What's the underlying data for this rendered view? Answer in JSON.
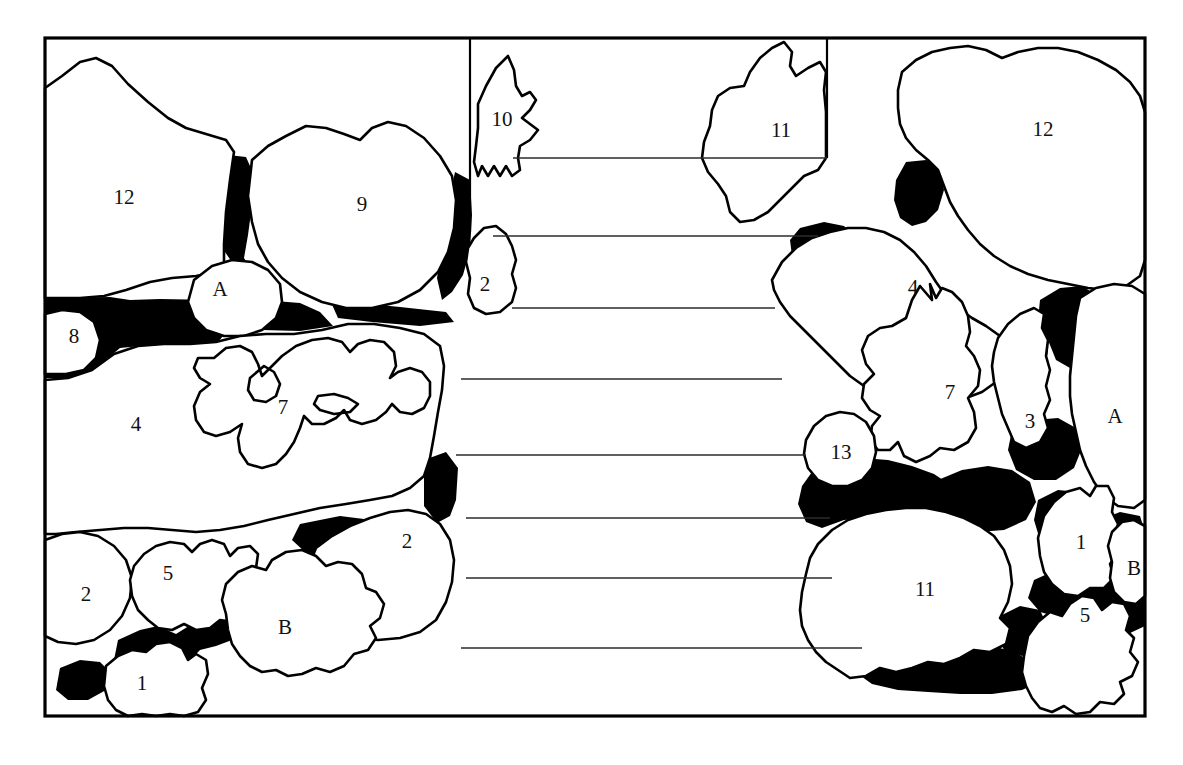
{
  "figure": {
    "panel_count": 2,
    "frame_color": "#000000",
    "grain_fill": "#ffffff",
    "interstitial_fill": "#000000",
    "outline_color": "#000000",
    "tie_line_color": "#2b2b2b"
  },
  "labels": {
    "left_panel": [
      {
        "id": "l-12",
        "text": "12",
        "x": 124,
        "y": 199
      },
      {
        "id": "l-9",
        "text": "9",
        "x": 362,
        "y": 206
      },
      {
        "id": "l-A",
        "text": "A",
        "x": 220,
        "y": 291
      },
      {
        "id": "l-8",
        "text": "8",
        "x": 74,
        "y": 338
      },
      {
        "id": "l-4",
        "text": "4",
        "x": 136,
        "y": 426
      },
      {
        "id": "l-7",
        "text": "7",
        "x": 283,
        "y": 409
      },
      {
        "id": "l-2a",
        "text": "2",
        "x": 485,
        "y": 286
      },
      {
        "id": "l-2b",
        "text": "2",
        "x": 407,
        "y": 543
      },
      {
        "id": "l-2c",
        "text": "2",
        "x": 86,
        "y": 596
      },
      {
        "id": "l-5",
        "text": "5",
        "x": 168,
        "y": 575
      },
      {
        "id": "l-B",
        "text": "B",
        "x": 285,
        "y": 629
      },
      {
        "id": "l-1",
        "text": "1",
        "x": 142,
        "y": 685
      },
      {
        "id": "l-10",
        "text": "10",
        "x": 502,
        "y": 121
      }
    ],
    "right_panel": [
      {
        "id": "r-11a",
        "text": "11",
        "x": 781,
        "y": 132
      },
      {
        "id": "r-12",
        "text": "12",
        "x": 1043,
        "y": 131
      },
      {
        "id": "r-4",
        "text": "4",
        "x": 913,
        "y": 289
      },
      {
        "id": "r-7",
        "text": "7",
        "x": 950,
        "y": 394
      },
      {
        "id": "r-3",
        "text": "3",
        "x": 1030,
        "y": 423
      },
      {
        "id": "r-A",
        "text": "A",
        "x": 1115,
        "y": 418
      },
      {
        "id": "r-13",
        "text": "13",
        "x": 841,
        "y": 454
      },
      {
        "id": "r-1",
        "text": "1",
        "x": 1081,
        "y": 544
      },
      {
        "id": "r-B",
        "text": "B",
        "x": 1134,
        "y": 570
      },
      {
        "id": "r-11b",
        "text": "11",
        "x": 925,
        "y": 591
      },
      {
        "id": "r-5",
        "text": "5",
        "x": 1085,
        "y": 617
      }
    ]
  },
  "tie_lines": [
    {
      "id": "tie-1",
      "y": 158,
      "x1": 513,
      "x2": 827
    },
    {
      "id": "tie-2",
      "y": 236,
      "x1": 493,
      "x2": 818
    },
    {
      "id": "tie-3",
      "y": 308,
      "x1": 512,
      "x2": 775
    },
    {
      "id": "tie-4",
      "y": 379,
      "x1": 461,
      "x2": 782
    },
    {
      "id": "tie-5",
      "y": 455,
      "x1": 456,
      "x2": 806
    },
    {
      "id": "tie-6",
      "y": 518,
      "x1": 466,
      "x2": 830
    },
    {
      "id": "tie-7",
      "y": 578,
      "x1": 466,
      "x2": 832
    },
    {
      "id": "tie-8",
      "y": 648,
      "x1": 461,
      "x2": 862
    }
  ],
  "panel_dividers": [
    {
      "id": "divider-left",
      "x": 470,
      "y1": 40,
      "y2": 232
    },
    {
      "id": "divider-right",
      "x": 827,
      "y1": 40,
      "y2": 158
    }
  ],
  "frame": {
    "x": 45,
    "y": 38,
    "width": 1100,
    "height": 678
  }
}
